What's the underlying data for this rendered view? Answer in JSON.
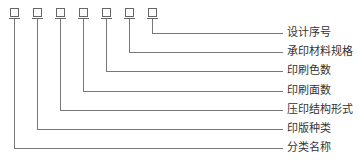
{
  "diagram": {
    "type": "code-structure",
    "box_count": 7,
    "labels": [
      {
        "text": "设计序号",
        "box_index": 7
      },
      {
        "text": "承印材料规格",
        "box_index": 6
      },
      {
        "text": "印刷色数",
        "box_index": 5
      },
      {
        "text": "印刷面数",
        "box_index": 4
      },
      {
        "text": "压印结构形式",
        "box_index": 3
      },
      {
        "text": "印版种类",
        "box_index": 2
      },
      {
        "text": "分类名称",
        "box_index": 1
      }
    ],
    "line_color": "#777777"
  }
}
